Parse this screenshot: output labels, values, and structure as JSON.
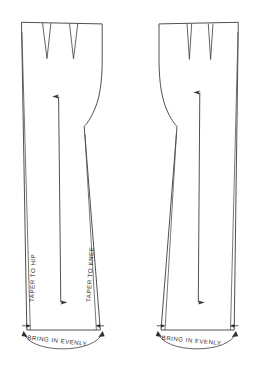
{
  "diagram": {
    "type": "sewing-pattern-technical-drawing",
    "background_color": "#ffffff",
    "line_color": "#3c3c3c",
    "text_color": "#2b2b2b"
  },
  "annotations": {
    "taper_to_hip": "TAPER TO HIP",
    "taper_to_knee": "TAPER TO KNEE",
    "bring_in_evenly_left": "BRING IN EVENLY",
    "bring_in_evenly_right": "BRING IN EVENLY"
  },
  "pieces": [
    {
      "name": "left-pattern-piece",
      "darts": 2,
      "grainline": "double-headed-vertical-arrow",
      "taper_labels": [
        "TAPER TO HIP",
        "TAPER TO KNEE"
      ],
      "hem_label": "BRING IN EVENLY"
    },
    {
      "name": "right-pattern-piece",
      "darts": 2,
      "grainline": "double-headed-vertical-arrow",
      "taper_labels": [],
      "hem_label": "BRING IN EVENLY"
    }
  ],
  "icons": {
    "grainline_arrow": "double-arrow-icon",
    "hem_inward_arrow": "arrow-inward-icon",
    "hem_arc_arrow": "curved-arrow-icon"
  }
}
